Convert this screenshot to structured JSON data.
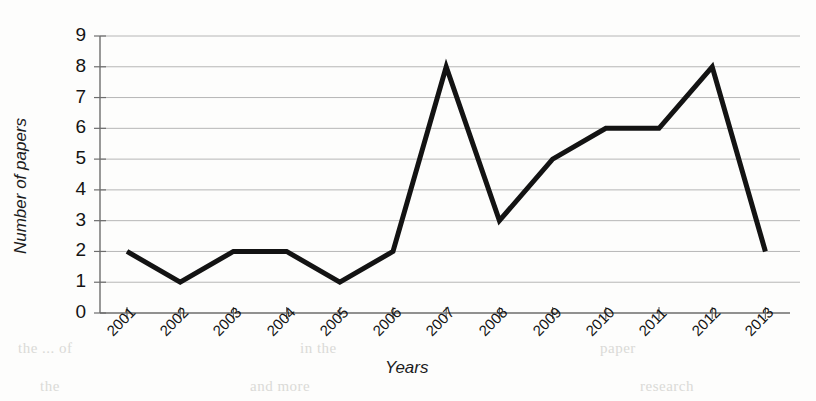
{
  "chart_data": {
    "type": "line",
    "title": "",
    "xlabel": "Years",
    "ylabel": "Number of papers",
    "categories": [
      "2001",
      "2002",
      "2003",
      "2004",
      "2005",
      "2006",
      "2007",
      "2008",
      "2009",
      "2010",
      "2011",
      "2012",
      "2013"
    ],
    "values": [
      2,
      1,
      2,
      2,
      1,
      2,
      8,
      3,
      5,
      6,
      6,
      8,
      2
    ],
    "series": [
      {
        "name": "Number of papers",
        "values": [
          2,
          1,
          2,
          2,
          1,
          2,
          8,
          3,
          5,
          6,
          6,
          8,
          2
        ]
      }
    ],
    "ylim": [
      0,
      9
    ],
    "ytick_labels": [
      "0",
      "1",
      "2",
      "3",
      "4",
      "5",
      "6",
      "7",
      "8",
      "9"
    ],
    "ytick_values": [
      0,
      1,
      2,
      3,
      4,
      5,
      6,
      7,
      8,
      9
    ],
    "grid": true,
    "grid_axis": "y",
    "legend": false,
    "legend_position": "none",
    "line_color": "#131313",
    "line_width": 5,
    "markers": false,
    "grid_color": "#b6b6b6",
    "axis_color": "#6d6d6d",
    "background_color": "#fdfdfc"
  },
  "artifacts": {
    "bleed_left": "the ... of",
    "bleed_mid": "in the",
    "bleed_right": "paper",
    "bleed_lower_left": "the",
    "bleed_lower_mid": "and more",
    "bleed_lower_right": "research"
  }
}
